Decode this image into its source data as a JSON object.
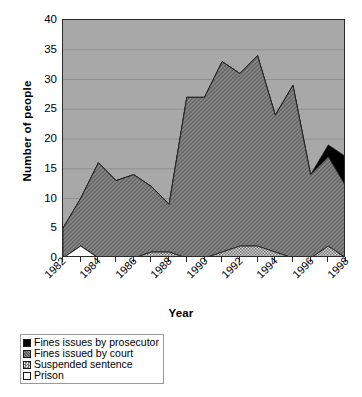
{
  "chart_data": {
    "type": "area",
    "stacked": true,
    "title": "",
    "xlabel": "Year",
    "ylabel": "Number of people",
    "ylim": [
      0,
      40
    ],
    "ytick_step": 5,
    "yticks": [
      0,
      5,
      10,
      15,
      20,
      25,
      30,
      35,
      40
    ],
    "grid": "horizontal",
    "x": [
      1982,
      1983,
      1984,
      1985,
      1986,
      1987,
      1988,
      1989,
      1990,
      1991,
      1992,
      1993,
      1994,
      1995,
      1996,
      1997,
      1998
    ],
    "tick_labels": [
      "1982",
      "1984",
      "1986",
      "1988",
      "1990",
      "1992",
      "1994",
      "1996",
      "1998"
    ],
    "tick_label_years": [
      1982,
      1984,
      1986,
      1988,
      1990,
      1992,
      1994,
      1996,
      1998
    ],
    "legend_position": "below-plot-left",
    "series": [
      {
        "name": "Prison",
        "color": "#ffffff",
        "order": 1,
        "values": [
          0,
          2,
          0,
          0,
          0,
          0,
          0,
          0,
          0,
          0,
          0,
          0,
          0,
          0,
          0,
          0,
          0
        ]
      },
      {
        "name": "Suspended sentence",
        "color": "#c2c2c2",
        "order": 2,
        "values": [
          0,
          0,
          0,
          0,
          0,
          1,
          1,
          0,
          0,
          1,
          2,
          2,
          1,
          0,
          0,
          2,
          0
        ]
      },
      {
        "name": "Fines issued by court",
        "color": "#808080",
        "order": 3,
        "values": [
          5,
          8,
          16,
          13,
          14,
          11,
          8,
          27,
          27,
          32,
          29,
          32,
          23,
          29,
          14,
          15,
          12
        ]
      },
      {
        "name": "Fines issues by prosecutor",
        "color": "#000000",
        "order": 4,
        "values": [
          0,
          0,
          0,
          0,
          0,
          0,
          0,
          0,
          0,
          0,
          0,
          0,
          0,
          0,
          0,
          2,
          5
        ]
      }
    ],
    "totals": [
      5,
      10,
      16,
      13,
      14,
      12,
      9,
      27,
      27,
      33,
      31,
      34,
      24,
      29,
      14,
      19,
      17
    ]
  },
  "legend": {
    "items": [
      {
        "label": "Fines issues by prosecutor",
        "swatch": "black"
      },
      {
        "label": "Fines issued by court",
        "swatch": "gray"
      },
      {
        "label": "Suspended sentence",
        "swatch": "light-gray"
      },
      {
        "label": "Prison",
        "swatch": "white"
      }
    ]
  },
  "axes": {
    "x_title": "Year",
    "y_title": "Number of people"
  },
  "colors": {
    "plot_background": "#a8a8a8",
    "axis": "#2b2b2b",
    "gridline": "#8d8d8d",
    "page_background": "#ffffff"
  }
}
